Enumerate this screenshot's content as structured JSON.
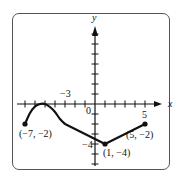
{
  "chart_data": {
    "type": "line",
    "title": "",
    "xlabel": "x",
    "ylabel": "y",
    "xlim": [
      -8,
      6
    ],
    "ylim": [
      -6,
      8
    ],
    "grid": false,
    "x_tick_labels": [
      {
        "value": -3,
        "text": "−3"
      },
      {
        "value": 0,
        "text": "0"
      },
      {
        "value": 5,
        "text": "5"
      }
    ],
    "y_tick_labels": [
      {
        "value": -4,
        "text": "−4"
      }
    ],
    "series": [
      {
        "name": "f",
        "points": [
          [
            -7,
            -2
          ],
          [
            -6.5,
            -0.9
          ],
          [
            -6,
            -0.25
          ],
          [
            -5.5,
            0
          ],
          [
            -5,
            0
          ],
          [
            -4.5,
            -0.3
          ],
          [
            -4,
            -0.8
          ],
          [
            -3.5,
            -1.5
          ],
          [
            -3,
            -2
          ],
          [
            1,
            -4
          ],
          [
            5,
            -2
          ]
        ]
      }
    ],
    "endpoints": [
      {
        "x": -7,
        "y": -2,
        "label": "(−7, −2)"
      },
      {
        "x": 1,
        "y": -4,
        "label": "(1, −4)"
      },
      {
        "x": 5,
        "y": -2,
        "label": "(5, −2)"
      }
    ]
  }
}
